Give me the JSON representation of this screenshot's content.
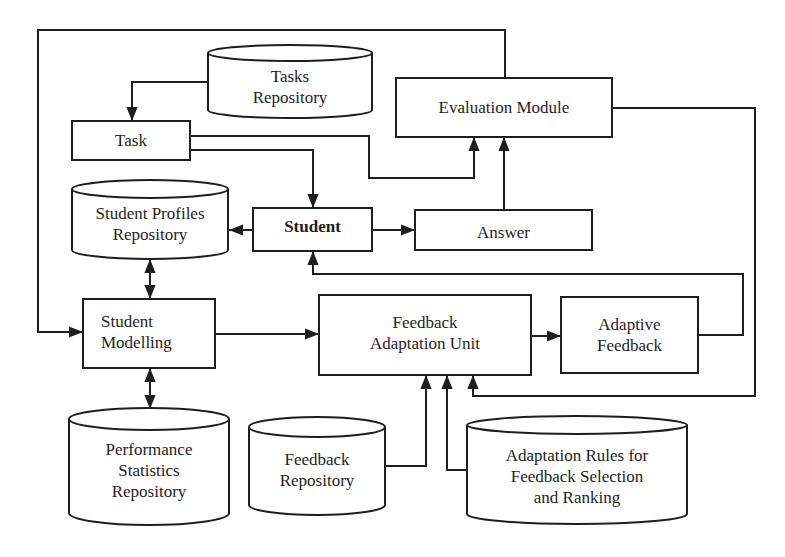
{
  "diagram": {
    "type": "architecture-flow",
    "colors": {
      "stroke": "#1e1e1e",
      "background": "#ffffff",
      "text": "#1e1e1e"
    },
    "nodes": {
      "tasks_repository": {
        "label": "Tasks\nRepository",
        "shape": "cylinder"
      },
      "task": {
        "label": "Task",
        "shape": "box"
      },
      "evaluation_module": {
        "label": "Evaluation Module",
        "shape": "box"
      },
      "student_profiles_repository": {
        "label": "Student Profiles\nRepository",
        "shape": "cylinder"
      },
      "student": {
        "label": "Student",
        "shape": "box",
        "bold": true
      },
      "answer": {
        "label": "Answer",
        "shape": "box"
      },
      "student_modelling": {
        "label": "Student\nModelling",
        "shape": "box"
      },
      "feedback_adaptation_unit": {
        "label": "Feedback\nAdaptation Unit",
        "shape": "box"
      },
      "adaptive_feedback": {
        "label": "Adaptive\nFeedback",
        "shape": "box"
      },
      "performance_statistics_repository": {
        "label": "Performance\nStatistics\nRepository",
        "shape": "cylinder"
      },
      "feedback_repository": {
        "label": "Feedback\nRepository",
        "shape": "cylinder"
      },
      "adaptation_rules": {
        "label": "Adaptation Rules for\nFeedback Selection\nand Ranking",
        "shape": "cylinder"
      }
    },
    "edges": [
      {
        "from": "tasks_repository",
        "to": "task"
      },
      {
        "from": "task",
        "to": "student"
      },
      {
        "from": "task",
        "to": "evaluation_module"
      },
      {
        "from": "answer",
        "to": "evaluation_module"
      },
      {
        "from": "student",
        "to": "answer"
      },
      {
        "from": "student",
        "to": "student_profiles_repository"
      },
      {
        "from": "student_profiles_repository",
        "to": "student_modelling",
        "bidirectional": true
      },
      {
        "from": "student_modelling",
        "to": "performance_statistics_repository",
        "bidirectional": true
      },
      {
        "from": "evaluation_module",
        "to": "student_modelling"
      },
      {
        "from": "evaluation_module",
        "to": "feedback_adaptation_unit"
      },
      {
        "from": "student_modelling",
        "to": "feedback_adaptation_unit"
      },
      {
        "from": "feedback_adaptation_unit",
        "to": "adaptive_feedback"
      },
      {
        "from": "adaptive_feedback",
        "to": "student"
      },
      {
        "from": "feedback_repository",
        "to": "feedback_adaptation_unit"
      },
      {
        "from": "adaptation_rules",
        "to": "feedback_adaptation_unit"
      }
    ]
  }
}
